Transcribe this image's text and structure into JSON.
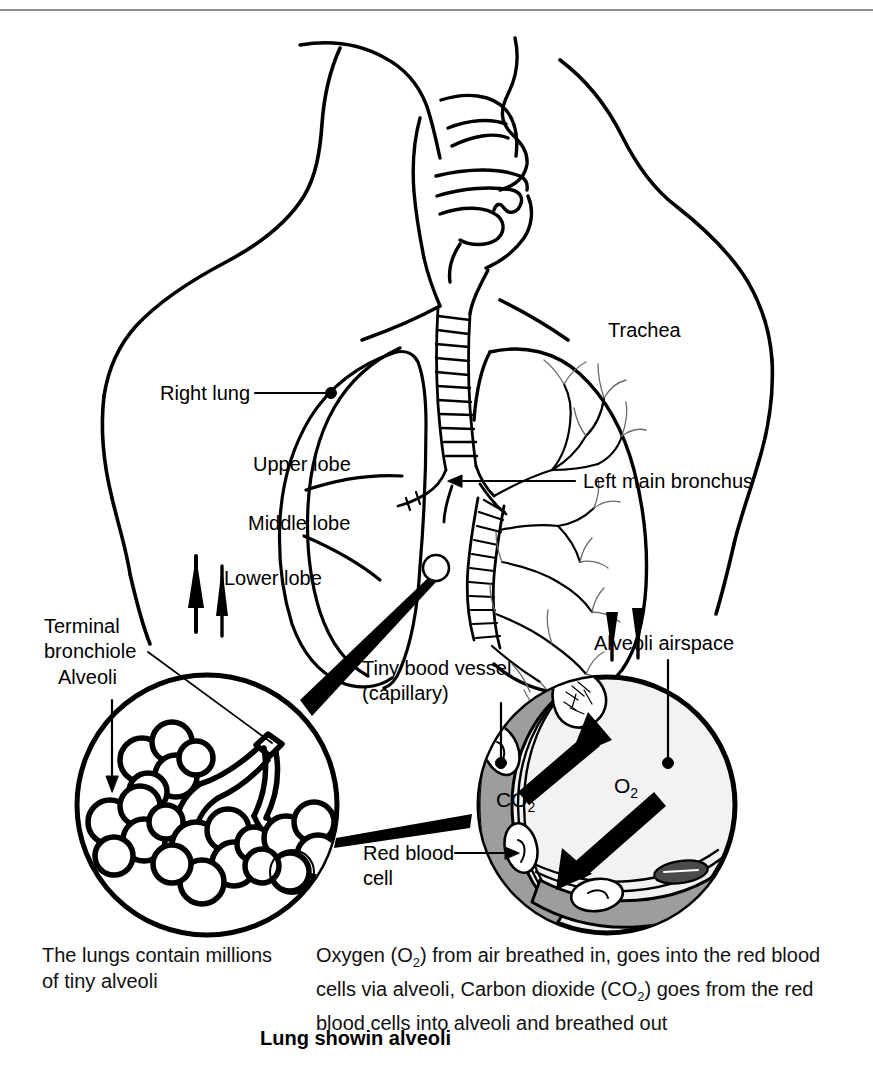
{
  "figure": {
    "title": "Lung showin alveoli",
    "top_rule_color": "#8d8d8d",
    "ink_color": "#000000",
    "capillary_fill": "#9d9d9d",
    "airspace_fill": "#f2f2f2"
  },
  "labels": {
    "trachea": "Trachea",
    "right_lung": "Right lung",
    "upper_lobe": "Upper lobe",
    "middle_lobe": "Middle lobe",
    "lower_lobe": "Lower lobe",
    "left_main_bronchus": "Left main bronchus",
    "terminal_bronchiole_line1": "Terminal",
    "terminal_bronchiole_line2": "bronchiole",
    "alveoli": "Alveoli",
    "tiny_blood_vessel_line1": "Tiny bood vessel",
    "tiny_blood_vessel_line2": "(capillary)",
    "alveoli_airspace": "Alveoli airspace",
    "red_blood_cell_line1": "Red blood",
    "red_blood_cell_line2": "cell",
    "co2": "CO",
    "co2_sub": "2",
    "o2": "O",
    "o2_sub": "2"
  },
  "captions": {
    "left_line1": "The lungs contain millions",
    "left_line2": "of tiny alveoli",
    "right_line1_a": "Oxygen (O",
    "right_line1_sub": "2",
    "right_line1_b": ") from air breathed in, goes into the red blood",
    "right_line2_a": "cells via alveoli, Carbon dioxide (CO",
    "right_line2_sub": "2",
    "right_line2_b": ") goes from the red",
    "right_line3": "blood cells into alveoli and breathed out"
  }
}
